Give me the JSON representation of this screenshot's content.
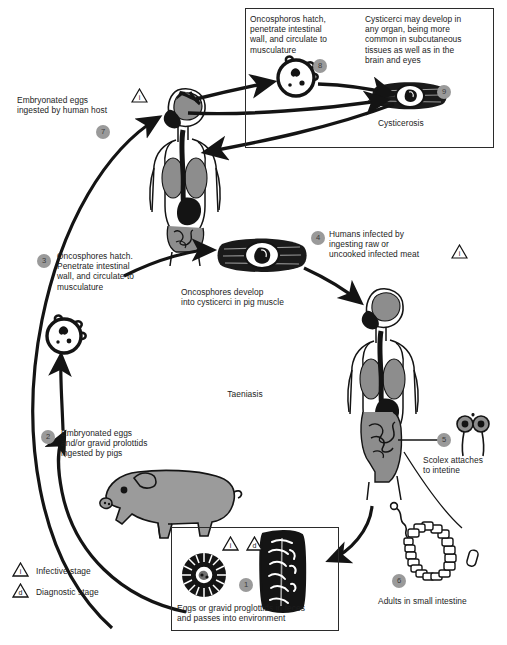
{
  "diagram": {
    "center_label": "Taeniasis",
    "colors": {
      "badge_fill": "#9a9a9a",
      "badge_text": "#3a3a3a",
      "line": "#141414",
      "organ_gray": "#8d8d8d",
      "pig_gray": "#9b9b9b",
      "text": "#1c1c1c",
      "background": "#ffffff"
    }
  },
  "cysticercosis_box": {
    "label": "Cysticerosis",
    "note_8": "Oncosphoros hatch,\npenetrate intestinal\nwall, and circulate to\nmusculature",
    "note_9": "Cysticerci may develop in\nany organ, being more\ncommon in subcutaneous\ntissues as well as in the\nbrain and eyes",
    "badge_8": "8",
    "badge_9": "9"
  },
  "feces_box": {
    "caption": "Eggs or gravid proglottids in feces\nand passes into environment",
    "badge_1": "1",
    "triangle_infective": "i",
    "triangle_diagnostic": "d"
  },
  "steps": [
    {
      "num": "7",
      "text": "Embryonated eggs\ningested by human host"
    },
    {
      "num": "3",
      "text": "Oncosphores hatch.\nPenetrate intestinal\nwall, and circulate to\nmusculature"
    },
    {
      "num": "2",
      "text": "Embryonated eggs\nand/or gravid prolottids\ningested by pigs"
    },
    {
      "num": "4",
      "text": "Humans infected by\ningesting raw or\nuncooked infected meat"
    },
    {
      "num": "5",
      "text": "Scolex attaches\nto intetine"
    },
    {
      "num": "6",
      "text": "Adults in small intestine"
    }
  ],
  "annotations": {
    "pig_muscle": "Oncosphores develop\ninto cysticerci in pig muscle"
  },
  "legend": {
    "infective": {
      "mark": "i",
      "label": "Infective stage"
    },
    "diagnostic": {
      "mark": "d",
      "label": "Diagnostic stage"
    }
  }
}
